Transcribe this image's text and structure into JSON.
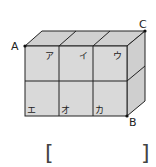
{
  "figure": {
    "type": "cuboid made of 6 cubes (3 wide x 2 high)",
    "vertex_labels": {
      "A": "A",
      "B": "B",
      "C": "C"
    },
    "cube_labels": {
      "top_row": [
        "ア",
        "イ",
        "ウ"
      ],
      "bottom_row": [
        "エ",
        "オ",
        "カ"
      ]
    },
    "colors": {
      "face": "#d9d9d9",
      "top": "#d0d0d0",
      "side": "#cfcfcf",
      "line": "#222222"
    }
  },
  "answer_box": {
    "left_bracket": "[",
    "right_bracket": "]",
    "value": ""
  }
}
